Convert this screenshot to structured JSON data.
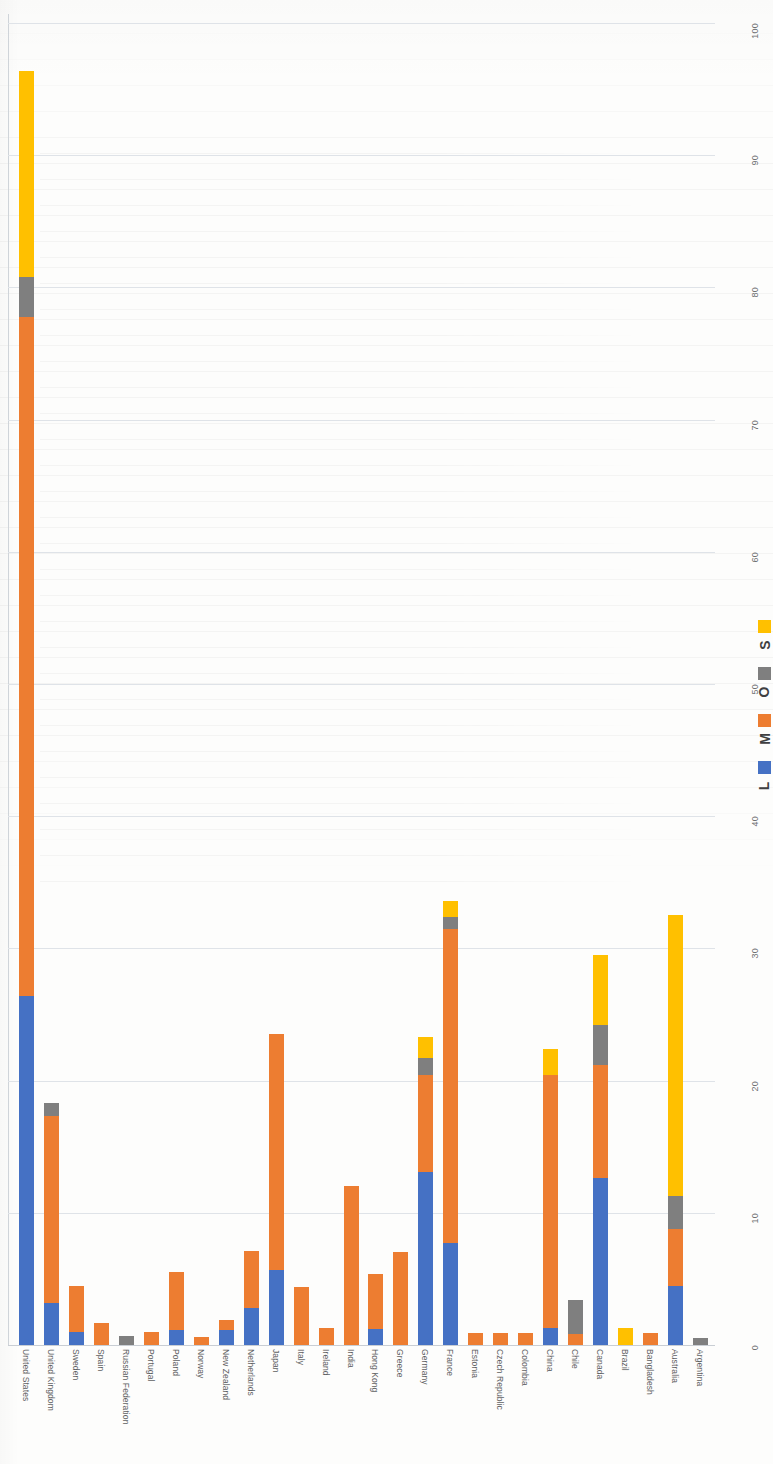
{
  "chart_data": {
    "type": "bar",
    "subtype": "stacked-bar-horizontal-rotated",
    "title": "",
    "xlabel": "",
    "ylabel": "",
    "ylim": [
      0,
      100
    ],
    "grid": true,
    "legend_position": "right",
    "tick_labels": [
      "0",
      "10",
      "20",
      "30",
      "40",
      "50",
      "60",
      "70",
      "80",
      "90",
      "100"
    ],
    "tick_values": [
      0,
      10,
      20,
      30,
      40,
      50,
      60,
      70,
      80,
      90,
      100
    ],
    "series_colors": {
      "L": "#4571c4",
      "M": "#ed7d31",
      "O": "#7f7f7f",
      "S": "#ffc000"
    },
    "categories": [
      "United States",
      "United Kingdom",
      "Sweden",
      "Spain",
      "Russian Federation",
      "Portugal",
      "Poland",
      "Norway",
      "New Zealand",
      "Netherlands",
      "Japan",
      "Italy",
      "Ireland",
      "India",
      "Hong Kong",
      "Greece",
      "Germany",
      "France",
      "Estonia",
      "Czech Republic",
      "Colombia",
      "China",
      "Chile",
      "Canada",
      "Brazil",
      "Bangladesh",
      "Australia",
      "Argentina"
    ],
    "series": [
      {
        "name": "L",
        "values": [
          26.4,
          3.2,
          1.0,
          0.0,
          0.0,
          0.0,
          1.1,
          0.0,
          1.1,
          2.8,
          5.7,
          0.0,
          0.0,
          0.0,
          1.2,
          0.0,
          13.1,
          7.7,
          0.0,
          0.0,
          0.0,
          1.3,
          0.0,
          12.6,
          0.0,
          0.0,
          4.5,
          0.0
        ]
      },
      {
        "name": "M",
        "values": [
          51.4,
          14.1,
          3.5,
          1.7,
          0.0,
          1.0,
          4.4,
          0.6,
          0.8,
          4.3,
          17.8,
          4.4,
          1.3,
          12.0,
          4.2,
          7.0,
          7.3,
          23.8,
          0.9,
          0.9,
          0.9,
          19.1,
          0.8,
          8.6,
          0.0,
          0.9,
          4.3,
          0.0
        ]
      },
      {
        "name": "O",
        "values": [
          3.0,
          1.0,
          0.0,
          0.0,
          0.7,
          0.0,
          0.0,
          0.0,
          0.0,
          0.0,
          0.0,
          0.0,
          0.0,
          0.0,
          0.0,
          0.0,
          1.3,
          0.9,
          0.0,
          0.0,
          0.0,
          0.0,
          2.6,
          3.0,
          0.0,
          0.0,
          2.5,
          0.5
        ]
      },
      {
        "name": "S",
        "values": [
          15.6,
          0.0,
          0.0,
          0.0,
          0.0,
          0.0,
          0.0,
          0.0,
          0.0,
          0.0,
          0.0,
          0.0,
          0.0,
          0.0,
          0.0,
          0.0,
          1.6,
          1.2,
          0.0,
          0.0,
          0.0,
          2.0,
          0.0,
          5.3,
          1.3,
          0.0,
          21.2,
          0.0
        ]
      }
    ],
    "totals": [
      96.4,
      18.3,
      4.5,
      1.7,
      0.7,
      1.0,
      5.5,
      0.6,
      1.9,
      7.1,
      23.5,
      4.4,
      1.3,
      12.0,
      5.4,
      7.0,
      23.3,
      33.6,
      0.9,
      0.9,
      0.9,
      22.4,
      3.4,
      29.5,
      1.3,
      0.9,
      32.5,
      0.5
    ]
  },
  "legend": {
    "items": [
      {
        "key": "L",
        "label": "L"
      },
      {
        "key": "M",
        "label": "M"
      },
      {
        "key": "O",
        "label": "O"
      },
      {
        "key": "S",
        "label": "S"
      }
    ]
  }
}
